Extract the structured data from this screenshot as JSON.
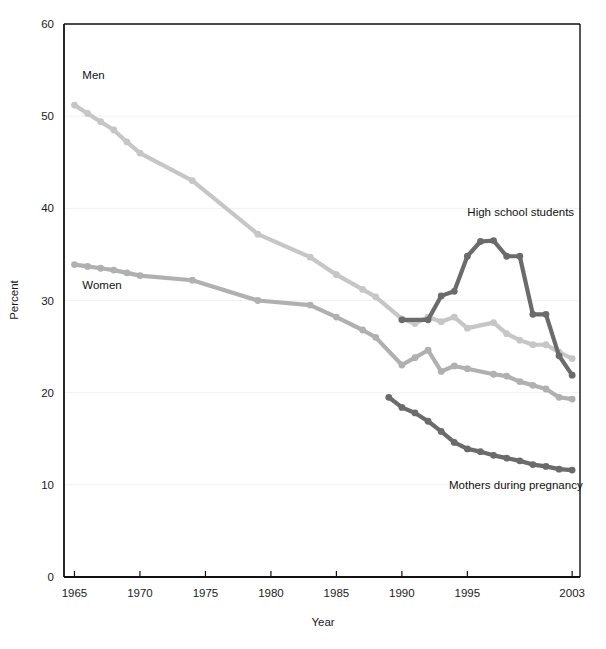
{
  "chart_data": {
    "type": "line",
    "title": "",
    "xlabel": "Year",
    "ylabel": "Percent",
    "xlim": [
      1964.2,
      2003.6
    ],
    "ylim": [
      0,
      60
    ],
    "yticks": [
      0,
      10,
      20,
      30,
      40,
      50,
      60
    ],
    "ytick_labels": [
      "0",
      "10",
      "20",
      "30",
      "40",
      "50",
      "60"
    ],
    "xticks": [
      1965,
      1970,
      1975,
      1980,
      1985,
      1990,
      1995,
      2003
    ],
    "xtick_labels": [
      "1965",
      "1970",
      "1975",
      "1980",
      "1985",
      "1990",
      "1995",
      "2003"
    ],
    "grid": "horizontal-faint",
    "legend_position": "inline-annotations",
    "series": [
      {
        "name": "Men",
        "color": "#c6c6c6",
        "label_text": "Men",
        "x": [
          1965,
          1966,
          1967,
          1968,
          1969,
          1970,
          1974,
          1979,
          1983,
          1985,
          1987,
          1988,
          1990,
          1991,
          1992,
          1993,
          1994,
          1995,
          1997,
          1998,
          1999,
          2000,
          2001,
          2002,
          2003
        ],
        "y": [
          51.2,
          50.3,
          49.4,
          48.5,
          47.2,
          46.0,
          43.0,
          37.2,
          34.7,
          32.8,
          31.2,
          30.4,
          28.0,
          27.5,
          28.2,
          27.7,
          28.2,
          27.0,
          27.6,
          26.4,
          25.7,
          25.2,
          25.2,
          24.4,
          23.7
        ]
      },
      {
        "name": "Women",
        "color": "#b0b0b0",
        "label_text": "Women",
        "x": [
          1965,
          1966,
          1967,
          1968,
          1969,
          1970,
          1974,
          1979,
          1983,
          1985,
          1987,
          1988,
          1990,
          1991,
          1992,
          1993,
          1994,
          1995,
          1997,
          1998,
          1999,
          2000,
          2001,
          2002,
          2003
        ],
        "y": [
          33.9,
          33.7,
          33.5,
          33.3,
          33.0,
          32.7,
          32.2,
          30.0,
          29.5,
          28.2,
          26.8,
          26.0,
          23.0,
          23.8,
          24.6,
          22.3,
          22.9,
          22.6,
          22.0,
          21.8,
          21.2,
          20.8,
          20.4,
          19.5,
          19.3
        ]
      },
      {
        "name": "High school students",
        "color": "#6b6b6b",
        "label_text": "High school students",
        "x": [
          1990,
          1992,
          1993,
          1994,
          1995,
          1996,
          1997,
          1998,
          1999,
          2000,
          2001,
          2002,
          2003
        ],
        "y": [
          27.9,
          27.9,
          30.5,
          31.0,
          34.8,
          36.4,
          36.5,
          34.8,
          34.8,
          28.5,
          28.5,
          24.0,
          21.9
        ]
      },
      {
        "name": "Mothers during pregnancy",
        "color": "#6b6b6b",
        "label_text": "Mothers during pregnancy",
        "x": [
          1989,
          1990,
          1991,
          1992,
          1993,
          1994,
          1995,
          1996,
          1997,
          1998,
          1999,
          2000,
          2001,
          2002,
          2003
        ],
        "y": [
          19.5,
          18.4,
          17.8,
          16.9,
          15.8,
          14.6,
          13.9,
          13.6,
          13.2,
          12.9,
          12.6,
          12.2,
          12.0,
          11.7,
          11.6
        ]
      }
    ],
    "annotations": [
      {
        "text": "Men",
        "x": 1965.6,
        "y": 54.0
      },
      {
        "text": "Women",
        "x": 1965.6,
        "y": 31.3
      },
      {
        "text": "High school students",
        "x": 1995.0,
        "y": 39.2
      },
      {
        "text": "Mothers during pregnancy",
        "x": 1993.6,
        "y": 9.5
      }
    ]
  }
}
